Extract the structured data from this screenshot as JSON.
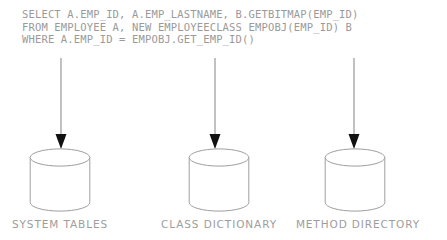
{
  "diagram": {
    "title_text_block": {
      "lines": [
        "SELECT A.EMP_ID, A.EMP_LASTNAME, B.GETBITMAP(EMP_ID)",
        "FROM EMPLOYEE A, NEW EMPLOYEECLASS EMPOBJ(EMP_ID) B",
        "WHERE A.EMP_ID = EMPOBJ.GET_EMP_ID()"
      ]
    },
    "colors": {
      "background": "#ffffff",
      "text": "#9a9a9a",
      "label_text": "#9d9d9d",
      "shape_stroke": "#9e9e9e",
      "arrow_line": "#8e8e8e",
      "arrow_head": "#111111"
    },
    "nodes": [
      {
        "id": "system-tables",
        "label": "SYSTEM TABLES",
        "icon": "database-cylinder-icon",
        "arrow_icon": "down-arrow-icon",
        "cylinder_left": 29,
        "label_left": 6,
        "label_width": 108,
        "arrow_left": 54
      },
      {
        "id": "class-dictionary",
        "label": "CLASS DICTIONARY",
        "icon": "database-cylinder-icon",
        "arrow_icon": "down-arrow-icon",
        "cylinder_left": 188,
        "label_left": 155,
        "label_width": 128,
        "arrow_left": 208
      },
      {
        "id": "method-directory",
        "label": "METHOD DIRECTORY",
        "icon": "database-cylinder-icon",
        "arrow_icon": "down-arrow-icon",
        "cylinder_left": 324,
        "label_left": 290,
        "label_width": 136,
        "arrow_left": 347
      }
    ]
  }
}
